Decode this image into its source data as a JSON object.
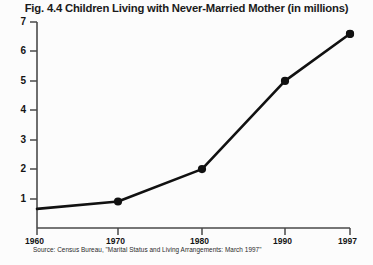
{
  "chart_data": {
    "type": "line",
    "title": "Fig. 4.4 Children Living with Never-Married Mother (in millions)",
    "xlabel": "",
    "ylabel": "",
    "x": [
      1960,
      1970,
      1980,
      1990,
      1997
    ],
    "categories": [
      "1960",
      "1970",
      "1980",
      "1990",
      "1997"
    ],
    "values": [
      0.65,
      0.9,
      2.0,
      5.0,
      6.6
    ],
    "series": [
      {
        "name": "Children living with never-married mother (millions)",
        "values": [
          0.65,
          0.9,
          2.0,
          5.0,
          6.6
        ]
      }
    ],
    "ylim": [
      0,
      7
    ],
    "xlim": [
      1960,
      1997
    ],
    "ytick_labels": [
      "1",
      "2",
      "3",
      "4",
      "5",
      "6",
      "7"
    ],
    "ytick_values": [
      1,
      2,
      3,
      4,
      5,
      6,
      7
    ],
    "xtick_labels": [
      "1960",
      "1970",
      "1980",
      "1990",
      "1997"
    ],
    "grid": false,
    "legend": false,
    "marker": "filled-circle",
    "line_color": "#111111",
    "marker_color": "#111111",
    "axis_color": "#4a4a4a"
  },
  "source": {
    "note": "Source: Census Bureau, \"Marital Status and Living Arrangements: March 1997\""
  },
  "colors": {
    "background": "#fcfcfc",
    "text": "#141414",
    "line": "#111111",
    "axis": "#4a4a4a"
  }
}
